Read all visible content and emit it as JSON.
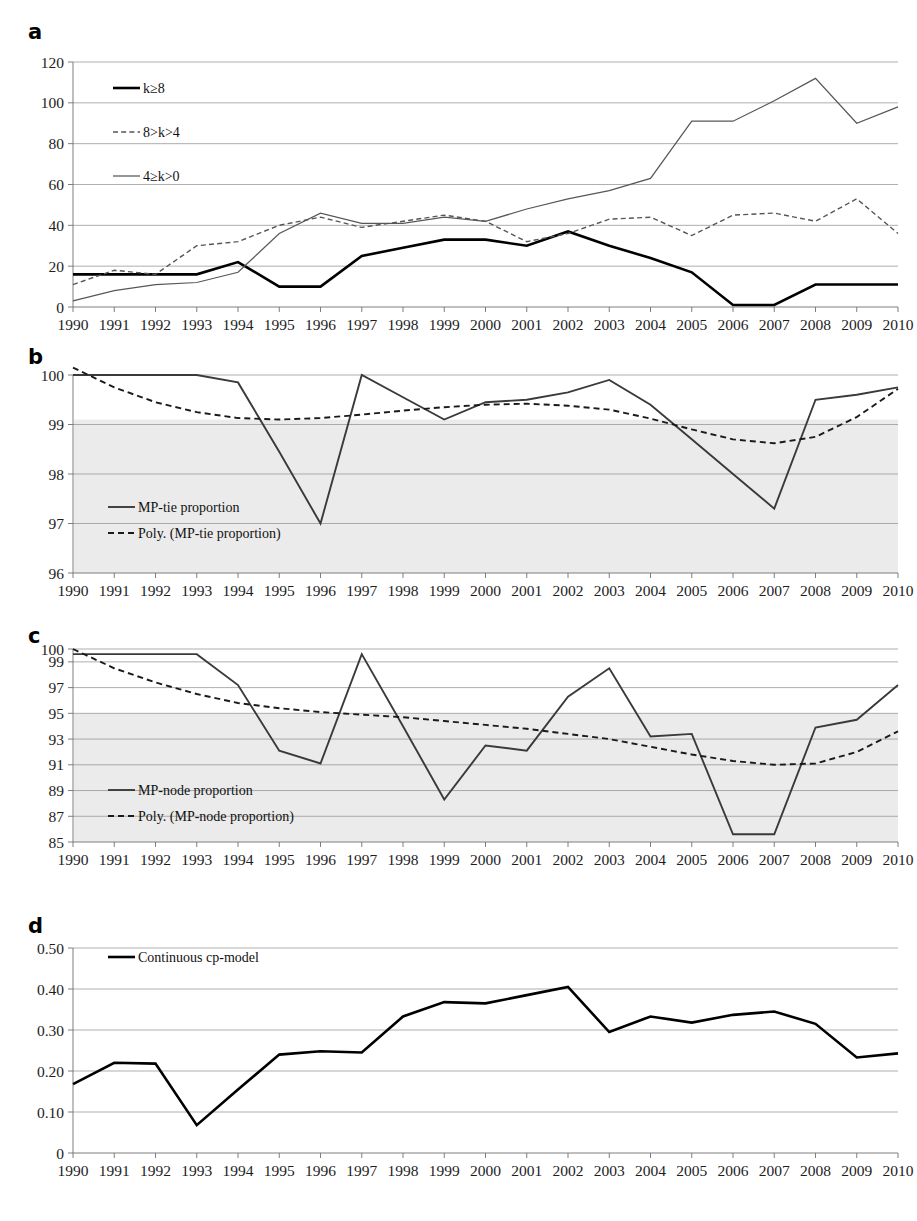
{
  "figure": {
    "panels": [
      "a",
      "b",
      "c",
      "d"
    ],
    "x_categories": [
      "1990",
      "1991",
      "1992",
      "1993",
      "1994",
      "1995",
      "1996",
      "1997",
      "1998",
      "1999",
      "2000",
      "2001",
      "2002",
      "2003",
      "2004",
      "2005",
      "2006",
      "2007",
      "2008",
      "2009",
      "2010"
    ]
  },
  "chart_data": [
    {
      "id": "panel-a",
      "panel": "a",
      "type": "line",
      "title": "",
      "xlabel": "",
      "ylabel": "",
      "x": [
        "1990",
        "1991",
        "1992",
        "1993",
        "1994",
        "1995",
        "1996",
        "1997",
        "1998",
        "1999",
        "2000",
        "2001",
        "2002",
        "2003",
        "2004",
        "2005",
        "2006",
        "2007",
        "2008",
        "2009",
        "2010"
      ],
      "ylim": [
        0,
        120
      ],
      "yticks": [
        0,
        20,
        40,
        60,
        80,
        100,
        120
      ],
      "ytick_labels": [
        "0",
        "20",
        "40",
        "60",
        "80",
        "100",
        "120"
      ],
      "grid": true,
      "legend_position": "top-left",
      "series": [
        {
          "name": "k≥8",
          "style": "solid-thick",
          "values": [
            16,
            16,
            16,
            16,
            22,
            10,
            10,
            25,
            29,
            33,
            33,
            30,
            37,
            30,
            24,
            17,
            1,
            1,
            11,
            11,
            11
          ]
        },
        {
          "name": "8>k>4",
          "style": "dashed",
          "values": [
            11,
            18,
            16,
            30,
            32,
            40,
            44,
            39,
            42,
            45,
            42,
            32,
            36,
            43,
            44,
            35,
            45,
            46,
            42,
            53,
            36
          ]
        },
        {
          "name": "4≥k>0",
          "style": "solid-thin",
          "values": [
            3,
            8,
            11,
            12,
            17,
            36,
            46,
            41,
            41,
            44,
            42,
            48,
            53,
            57,
            63,
            91,
            91,
            101,
            112,
            90,
            98
          ]
        }
      ]
    },
    {
      "id": "panel-b",
      "panel": "b",
      "type": "line",
      "title": "",
      "xlabel": "",
      "ylabel": "",
      "x": [
        "1990",
        "1991",
        "1992",
        "1993",
        "1994",
        "1995",
        "1996",
        "1997",
        "1998",
        "1999",
        "2000",
        "2001",
        "2002",
        "2003",
        "2004",
        "2005",
        "2006",
        "2007",
        "2008",
        "2009",
        "2010"
      ],
      "ylim": [
        96,
        100
      ],
      "yticks": [
        96,
        97,
        98,
        99,
        100
      ],
      "ytick_labels": [
        "96",
        "97",
        "98",
        "99",
        "100"
      ],
      "grid": true,
      "legend_position": "bottom-left",
      "shaded_band": [
        96,
        99.1
      ],
      "series": [
        {
          "name": "MP-tie proportion",
          "style": "solid-med",
          "values": [
            100.0,
            100.0,
            100.0,
            100.0,
            99.85,
            98.45,
            97.0,
            100.0,
            99.55,
            99.1,
            99.45,
            99.5,
            99.65,
            99.9,
            99.4,
            98.7,
            98.0,
            97.3,
            99.5,
            99.6,
            99.75
          ]
        },
        {
          "name": "Poly. (MP-tie proportion)",
          "style": "dashed-dark",
          "values": [
            100.15,
            99.75,
            99.45,
            99.25,
            99.13,
            99.1,
            99.13,
            99.2,
            99.28,
            99.35,
            99.4,
            99.42,
            99.38,
            99.3,
            99.12,
            98.9,
            98.7,
            98.62,
            98.75,
            99.15,
            99.72
          ]
        }
      ]
    },
    {
      "id": "panel-c",
      "panel": "c",
      "type": "line",
      "title": "",
      "xlabel": "",
      "ylabel": "",
      "x": [
        "1990",
        "1991",
        "1992",
        "1993",
        "1994",
        "1995",
        "1996",
        "1997",
        "1998",
        "1999",
        "2000",
        "2001",
        "2002",
        "2003",
        "2004",
        "2005",
        "2006",
        "2007",
        "2008",
        "2009",
        "2010"
      ],
      "ylim": [
        85,
        100
      ],
      "yticks": [
        85,
        87,
        89,
        91,
        93,
        95,
        97,
        99,
        100
      ],
      "ytick_labels": [
        "85",
        "87",
        "89",
        "91",
        "93",
        "95",
        "97",
        "99",
        "100"
      ],
      "grid": true,
      "legend_position": "bottom-left",
      "shaded_band": [
        85,
        95
      ],
      "series": [
        {
          "name": "MP-node proportion",
          "style": "solid-med",
          "values": [
            99.6,
            99.6,
            99.6,
            99.6,
            97.2,
            92.1,
            91.1,
            99.6,
            94.0,
            88.3,
            92.5,
            92.1,
            96.3,
            98.5,
            93.2,
            93.4,
            85.6,
            85.6,
            93.9,
            94.5,
            97.2
          ]
        },
        {
          "name": "Poly. (MP-node proportion)",
          "style": "dashed-dark",
          "values": [
            100.0,
            98.5,
            97.4,
            96.5,
            95.8,
            95.4,
            95.1,
            94.9,
            94.7,
            94.4,
            94.1,
            93.8,
            93.4,
            93.0,
            92.4,
            91.8,
            91.3,
            91.0,
            91.1,
            92.0,
            93.6
          ]
        }
      ]
    },
    {
      "id": "panel-d",
      "panel": "d",
      "type": "line",
      "title": "",
      "xlabel": "",
      "ylabel": "",
      "x": [
        "1990",
        "1991",
        "1992",
        "1993",
        "1994",
        "1995",
        "1996",
        "1997",
        "1998",
        "1999",
        "2000",
        "2001",
        "2002",
        "2003",
        "2004",
        "2005",
        "2006",
        "2007",
        "2008",
        "2009",
        "2010"
      ],
      "ylim": [
        0,
        0.5
      ],
      "yticks": [
        0,
        0.1,
        0.2,
        0.3,
        0.4,
        0.5
      ],
      "ytick_labels": [
        "0",
        "0.10",
        "0.20",
        "0.30",
        "0.40",
        "0.50"
      ],
      "grid": true,
      "legend_position": "top-left",
      "series": [
        {
          "name": "Continuous cp-model",
          "style": "solid-thick",
          "values": [
            0.168,
            0.22,
            0.218,
            0.068,
            0.155,
            0.24,
            0.248,
            0.245,
            0.333,
            0.368,
            0.365,
            0.385,
            0.405,
            0.295,
            0.333,
            0.318,
            0.337,
            0.345,
            0.315,
            0.233,
            0.243
          ]
        }
      ]
    }
  ]
}
